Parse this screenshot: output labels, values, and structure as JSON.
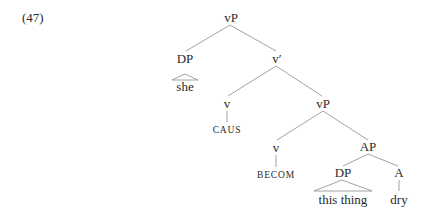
{
  "example_number": "(47)",
  "tree": {
    "root": "vP",
    "spec_dp": "DP",
    "spec_dp_leaf": "she",
    "v_bar": "v′",
    "v_caus": "v",
    "v_caus_leaf": "CAUS",
    "vp_inner": "vP",
    "v_becom": "v",
    "v_becom_leaf": "BECOM",
    "ap": "AP",
    "ap_dp": "DP",
    "ap_dp_leaf": "this thing",
    "a_head": "A",
    "a_leaf": "dry"
  },
  "colors": {
    "line": "#8a8a8a",
    "text": "#2a2a2a"
  }
}
